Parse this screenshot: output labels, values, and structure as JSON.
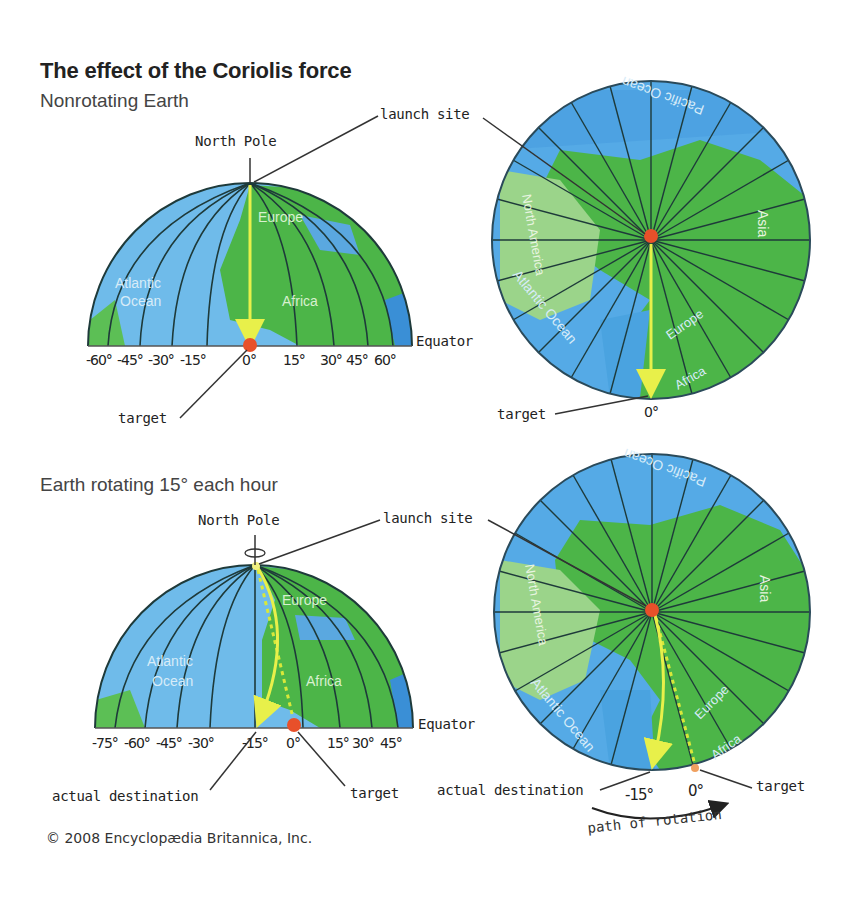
{
  "title": "The effect of the Coriolis force",
  "panels": [
    {
      "subtitle": "Nonrotating Earth",
      "side_view": {
        "north_pole_label": "North Pole",
        "equator_label": "Equator",
        "target_label": "target",
        "continents": [
          "Europe",
          "Atlantic Ocean",
          "Africa"
        ],
        "longitude_ticks": [
          "-60°",
          "-45°",
          "-30°",
          "-15°",
          "0°",
          "15°",
          "30°",
          "45°",
          "60°"
        ]
      },
      "polar_view": {
        "launch_site_label": "launch site",
        "target_label": "target",
        "target_longitude": "0°",
        "regions": [
          "Pacific Ocean",
          "North America",
          "Asia",
          "Atlantic Ocean",
          "Europe",
          "Africa"
        ]
      }
    },
    {
      "subtitle": "Earth rotating 15° each hour",
      "side_view": {
        "north_pole_label": "North Pole",
        "equator_label": "Equator",
        "target_label": "target",
        "actual_destination_label": "actual destination",
        "continents": [
          "Europe",
          "Atlantic Ocean",
          "Africa"
        ],
        "longitude_ticks": [
          "-75°",
          "-60°",
          "-45°",
          "-30°",
          "-15°",
          "0°",
          "15°",
          "30°",
          "45°"
        ]
      },
      "polar_view": {
        "launch_site_label": "launch site",
        "target_label": "target",
        "actual_destination_label": "actual destination",
        "actual_longitude": "-15°",
        "target_longitude": "0°",
        "rotation_label": "path of rotation",
        "regions": [
          "Pacific Ocean",
          "North America",
          "Asia",
          "Atlantic Ocean",
          "Europe",
          "Africa"
        ]
      }
    }
  ],
  "copyright": "© 2008 Encyclopædia Britannica, Inc.",
  "colors": {
    "ocean": "#4aa3e0",
    "ocean_light": "#7cc4ee",
    "land": "#4cb548",
    "land_light": "#8fd17a",
    "meridian": "#1e3a3a",
    "path_arrow": "#e8f04a",
    "target_dot": "#e8502a"
  }
}
